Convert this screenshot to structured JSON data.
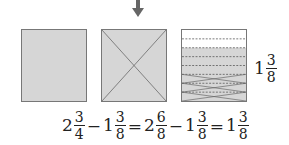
{
  "diagram": {
    "arrow": "down-arrow",
    "colors": {
      "shade": "#d6d6d6",
      "border": "#777777",
      "arrow": "#666666"
    },
    "boxes": [
      {
        "id": "box1",
        "pattern": "full"
      },
      {
        "id": "box2",
        "pattern": "x-cross"
      },
      {
        "id": "box3",
        "pattern": "eighths",
        "rows": 8,
        "white_rows": 2,
        "crossed_rows": 3
      }
    ],
    "result_label": {
      "whole": "1",
      "num": "3",
      "den": "8"
    },
    "equation": [
      {
        "type": "mixed",
        "whole": "2",
        "num": "3",
        "den": "4"
      },
      {
        "type": "op",
        "text": "−"
      },
      {
        "type": "mixed",
        "whole": "1",
        "num": "3",
        "den": "8"
      },
      {
        "type": "op",
        "text": "="
      },
      {
        "type": "mixed",
        "whole": "2",
        "num": "6",
        "den": "8"
      },
      {
        "type": "op",
        "text": "−"
      },
      {
        "type": "mixed",
        "whole": "1",
        "num": "3",
        "den": "8"
      },
      {
        "type": "op",
        "text": "="
      },
      {
        "type": "mixed",
        "whole": "1",
        "num": "3",
        "den": "8"
      }
    ]
  }
}
